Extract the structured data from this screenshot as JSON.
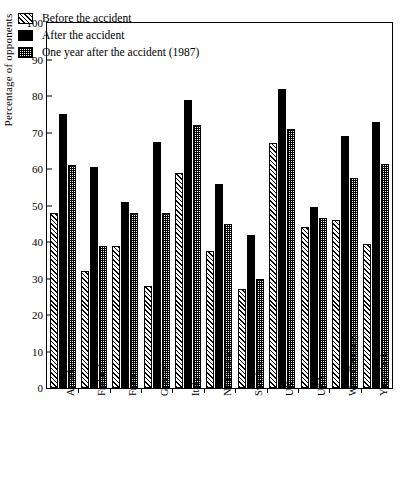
{
  "chart_data": {
    "type": "bar",
    "title": "",
    "xlabel": "",
    "ylabel": "Percentage of opponents",
    "ylim": [
      0,
      100
    ],
    "yticks": [
      0,
      10,
      20,
      30,
      40,
      50,
      60,
      70,
      80,
      90,
      100
    ],
    "grid": false,
    "legend_position": "top-left",
    "categories": [
      "Austria",
      "Finland",
      "France",
      "Greece",
      "Italy",
      "Netherlands",
      "Sweden",
      "UK",
      "USA",
      "West Germany",
      "Yugoslavia"
    ],
    "series": [
      {
        "name": "Before the accident",
        "pattern": "diagonal-hatch",
        "values": [
          48,
          32,
          39,
          28,
          59,
          37.5,
          27,
          67,
          44,
          46,
          39.5
        ]
      },
      {
        "name": "After the accident",
        "pattern": "solid-black",
        "values": [
          75,
          60.5,
          51,
          67.5,
          79,
          56,
          42,
          82,
          49.5,
          69,
          73
        ]
      },
      {
        "name": "One year after the accident (1987)",
        "pattern": "stipple-dots",
        "values": [
          61,
          39,
          48,
          48,
          72,
          45,
          30,
          71,
          46.5,
          57.5,
          61.5
        ]
      }
    ]
  }
}
